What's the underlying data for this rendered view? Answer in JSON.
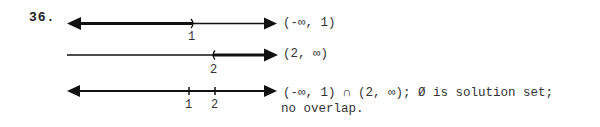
{
  "problem_number": "36.",
  "lines": [
    {
      "interval": "(-∞, 1)",
      "tick_labels": [
        "1"
      ]
    },
    {
      "interval": "(2, ∞)",
      "tick_labels": [
        "2"
      ]
    },
    {
      "interval_line1": "(-∞, 1) ∩ (2, ∞); Ø is solution set;",
      "interval_line2": "no overlap.",
      "tick_labels": [
        "1",
        "2"
      ]
    }
  ]
}
